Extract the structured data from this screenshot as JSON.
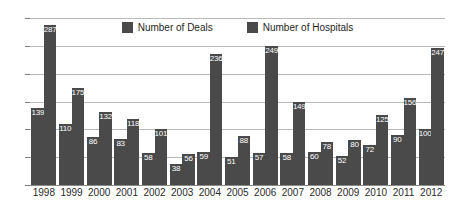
{
  "chart_data": {
    "type": "bar",
    "title": "",
    "subtitle": "",
    "xlabel": "",
    "ylabel": "",
    "ylim": [
      0,
      300
    ],
    "y_ticks": [
      0,
      50,
      100,
      150,
      200,
      250,
      300
    ],
    "grid": true,
    "legend_position": "top-center",
    "categories": [
      "1998",
      "1999",
      "2000",
      "2001",
      "2002",
      "2003",
      "2004",
      "2005",
      "2006",
      "2007",
      "2008",
      "2009",
      "2010",
      "2011",
      "2012"
    ],
    "series": [
      {
        "name": "Number of Deals",
        "color": "#4a4a4a",
        "values": [
          139,
          110,
          86,
          83,
          58,
          38,
          59,
          51,
          57,
          58,
          60,
          52,
          72,
          90,
          100
        ]
      },
      {
        "name": "Number of Hospitals",
        "color": "#4a4a4a",
        "values": [
          287,
          175,
          132,
          118,
          101,
          56,
          236,
          88,
          249,
          149,
          78,
          80,
          125,
          156,
          247
        ]
      }
    ]
  },
  "legend": {
    "items": [
      {
        "label": "Number of Deals"
      },
      {
        "label": "Number of Hospitals"
      }
    ]
  },
  "colors": {
    "bar": "#4a4a4a",
    "gridline": "#b9b9b9",
    "axis": "#8a8a8a",
    "text": "#2b2b2b",
    "value_label": "#ffffff",
    "background": "#ffffff"
  }
}
